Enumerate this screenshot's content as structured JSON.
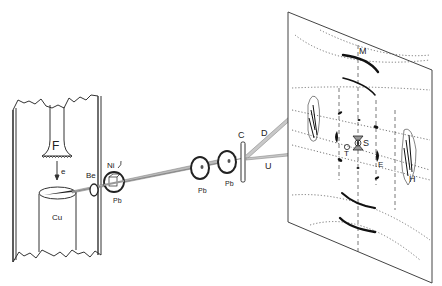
{
  "figure": {
    "type": "x-ray-diffraction-apparatus",
    "labels": {
      "filament": "F",
      "electrons": "e",
      "anode": "Cu",
      "window": "Be",
      "filter": "Ni",
      "collimator_1": "Pb",
      "collimator_2": "Pb",
      "collimator_3": "Pb",
      "crystal": "C",
      "diffracted_beam": "D",
      "undiffracted_beam": "U",
      "spot_m": "M",
      "spot_s": "S",
      "spot_t": "T",
      "spot_e": "E",
      "spot_h": "H"
    }
  }
}
